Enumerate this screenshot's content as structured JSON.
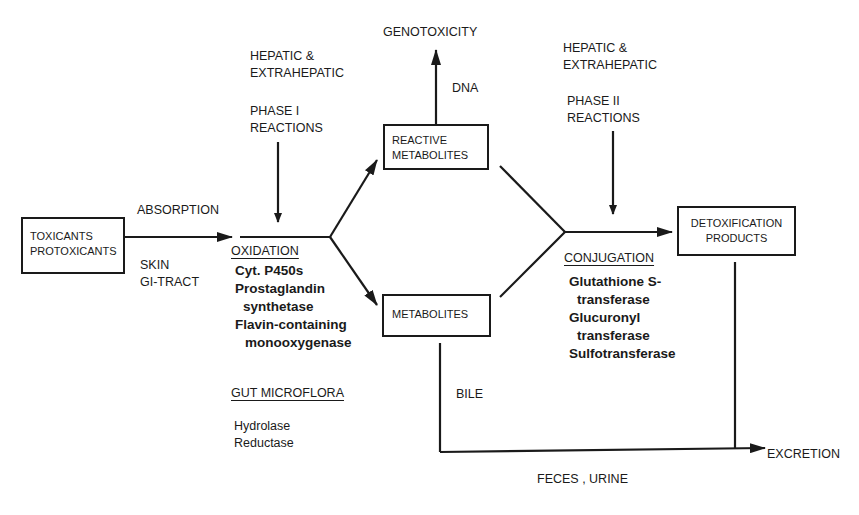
{
  "nodes": {
    "toxicants": {
      "line1": "TOXICANTS",
      "line2": "PROTOXICANTS"
    },
    "reactive_metabolites": {
      "line1": "REACTIVE",
      "line2": "METABOLITES"
    },
    "metabolites": {
      "line1": "METABOLITES"
    },
    "detoxification": {
      "line1": "DETOXIFICATION",
      "line2": "PRODUCTS"
    },
    "genotoxicity": "GENOTOXICITY",
    "excretion": "EXCRETION"
  },
  "labels": {
    "absorption": "ABSORPTION",
    "routes": [
      "SKIN",
      "GI-TRACT"
    ],
    "phase1_site": [
      "HEPATIC &",
      "EXTRAHEPATIC"
    ],
    "phase1": [
      "PHASE I",
      "REACTIONS"
    ],
    "phase2_site": [
      "HEPATIC &",
      "EXTRAHEPATIC"
    ],
    "phase2": [
      "PHASE II",
      "REACTIONS"
    ],
    "dna": "DNA",
    "bile": "BILE",
    "feces_urine": "FECES , URINE"
  },
  "oxidation": {
    "heading": "OXIDATION",
    "items": [
      "Cyt. P450s",
      "Prostaglandin",
      "synthetase",
      "Flavin-containing",
      "monooxygenase"
    ]
  },
  "gut_microflora": {
    "heading": "GUT MICROFLORA",
    "items": [
      "Hydrolase",
      "Reductase"
    ]
  },
  "conjugation": {
    "heading": "CONJUGATION",
    "items": [
      "Glutathione S-",
      "transferase",
      "Glucuronyl",
      "transferase",
      "Sulfotransferase"
    ]
  }
}
